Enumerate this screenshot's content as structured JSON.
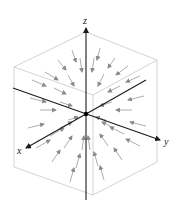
{
  "figure": {
    "type": "3d-vector-field",
    "colors": {
      "background": "#ffffff",
      "axis": "#1a1a1a",
      "cube_edge": "#c8c8c8",
      "vector": "#8a8a8a",
      "origin_dot": "#000000"
    }
  },
  "axes": {
    "x_label": "x",
    "y_label": "y",
    "z_label": "z"
  },
  "origin": [
    86,
    114
  ],
  "cube": {
    "vertices": {
      "top_back": [
        86,
        32
      ],
      "top_left": [
        14,
        67
      ],
      "top_right": [
        157,
        60
      ],
      "top_front": [
        93,
        95
      ],
      "bottom_left": [
        14,
        167
      ],
      "bottom_right": [
        157,
        162
      ],
      "bottom_front": [
        93,
        195
      ]
    }
  },
  "vectors": [
    [
      [
        72,
        50
      ],
      [
        76,
        62
      ]
    ],
    [
      [
        100,
        48
      ],
      [
        97,
        60
      ]
    ],
    [
      [
        58,
        60
      ],
      [
        66,
        70
      ]
    ],
    [
      [
        115,
        58
      ],
      [
        108,
        68
      ]
    ],
    [
      [
        80,
        58
      ],
      [
        82,
        72
      ]
    ],
    [
      [
        94,
        58
      ],
      [
        92,
        72
      ]
    ],
    [
      [
        45,
        72
      ],
      [
        58,
        80
      ]
    ],
    [
      [
        128,
        66
      ],
      [
        116,
        75
      ]
    ],
    [
      [
        32,
        80
      ],
      [
        46,
        86
      ]
    ],
    [
      [
        140,
        76
      ],
      [
        126,
        82
      ]
    ],
    [
      [
        68,
        75
      ],
      [
        74,
        86
      ]
    ],
    [
      [
        104,
        74
      ],
      [
        98,
        86
      ]
    ],
    [
      [
        54,
        88
      ],
      [
        66,
        94
      ]
    ],
    [
      [
        120,
        86
      ],
      [
        108,
        92
      ]
    ],
    [
      [
        30,
        98
      ],
      [
        46,
        102
      ]
    ],
    [
      [
        144,
        96
      ],
      [
        128,
        100
      ]
    ],
    [
      [
        40,
        110
      ],
      [
        56,
        110
      ]
    ],
    [
      [
        132,
        110
      ],
      [
        116,
        110
      ]
    ],
    [
      [
        60,
        102
      ],
      [
        72,
        106
      ]
    ],
    [
      [
        112,
        102
      ],
      [
        100,
        106
      ]
    ],
    [
      [
        28,
        128
      ],
      [
        44,
        124
      ]
    ],
    [
      [
        146,
        126
      ],
      [
        130,
        122
      ]
    ],
    [
      [
        50,
        136
      ],
      [
        64,
        128
      ]
    ],
    [
      [
        124,
        134
      ],
      [
        110,
        127
      ]
    ],
    [
      [
        36,
        148
      ],
      [
        50,
        140
      ]
    ],
    [
      [
        140,
        146
      ],
      [
        126,
        139
      ]
    ],
    [
      [
        64,
        148
      ],
      [
        72,
        136
      ]
    ],
    [
      [
        108,
        146
      ],
      [
        100,
        134
      ]
    ],
    [
      [
        52,
        162
      ],
      [
        60,
        150
      ]
    ],
    [
      [
        122,
        160
      ],
      [
        114,
        148
      ]
    ],
    [
      [
        76,
        168
      ],
      [
        80,
        154
      ]
    ],
    [
      [
        98,
        166
      ],
      [
        94,
        152
      ]
    ],
    [
      [
        70,
        182
      ],
      [
        74,
        168
      ]
    ],
    [
      [
        104,
        180
      ],
      [
        100,
        166
      ]
    ],
    [
      [
        82,
        150
      ],
      [
        84,
        136
      ]
    ],
    [
      [
        90,
        150
      ],
      [
        88,
        136
      ]
    ],
    [
      [
        68,
        120
      ],
      [
        78,
        117
      ]
    ],
    [
      [
        106,
        120
      ],
      [
        96,
        117
      ]
    ],
    [
      [
        60,
        128
      ],
      [
        72,
        122
      ]
    ],
    [
      [
        114,
        128
      ],
      [
        102,
        122
      ]
    ]
  ]
}
